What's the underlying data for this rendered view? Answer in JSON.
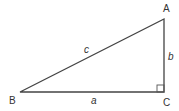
{
  "diagram": {
    "type": "right-triangle",
    "vertices": {
      "A": {
        "label": "A",
        "x": 164,
        "y": 19
      },
      "B": {
        "label": "B",
        "x": 20,
        "y": 92
      },
      "C": {
        "label": "C",
        "x": 164,
        "y": 92
      }
    },
    "sides": {
      "a": {
        "label": "a",
        "from": "B",
        "to": "C"
      },
      "b": {
        "label": "b",
        "from": "C",
        "to": "A"
      },
      "c": {
        "label": "c",
        "from": "B",
        "to": "A"
      }
    },
    "right_angle_at": "C",
    "colors": {
      "line": "#444444",
      "text": "#333333",
      "background": "#ffffff"
    }
  }
}
